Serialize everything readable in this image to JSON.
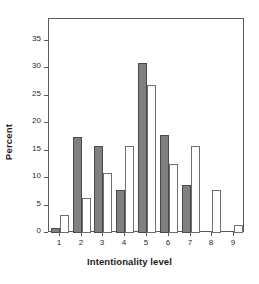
{
  "chart_data": {
    "type": "bar",
    "title": "",
    "subtitle": "",
    "xlabel": "Intentionality level",
    "ylabel": "Percent",
    "categories": [
      "1",
      "2",
      "3",
      "4",
      "5",
      "6",
      "7",
      "8",
      "9"
    ],
    "series": [
      {
        "name": "series-dark",
        "color": "#808080",
        "values": [
          1.0,
          17.5,
          15.8,
          7.9,
          31.0,
          17.9,
          8.8,
          0,
          0
        ]
      },
      {
        "name": "series-light",
        "color": "#ffffff",
        "values": [
          3.2,
          6.3,
          11.0,
          15.8,
          27.0,
          12.6,
          15.8,
          7.8,
          1.5
        ]
      }
    ],
    "ylim": [
      0,
      39
    ],
    "yticks": [
      0,
      5,
      10,
      15,
      20,
      25,
      30,
      35
    ],
    "ytick_labels": [
      "0",
      "5",
      "10",
      "15",
      "20",
      "25",
      "30",
      "35"
    ],
    "grid": false,
    "legend": "none",
    "axis_color": "#5c5c5c",
    "text_color": "#1b1b1b"
  }
}
